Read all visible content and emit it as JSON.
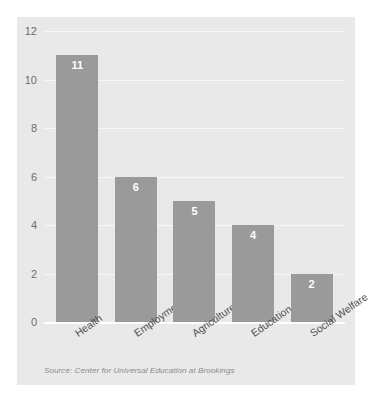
{
  "chart_data": {
    "type": "bar",
    "title": "",
    "xlabel": "",
    "ylabel": "",
    "categories": [
      "Health",
      "Employment",
      "Agriculture",
      "Education",
      "Social Welfare"
    ],
    "values": [
      11,
      6,
      5,
      4,
      2
    ],
    "value_labels": [
      "11",
      "6",
      "5",
      "4",
      "2"
    ],
    "ylim": [
      0,
      12
    ],
    "yticks": [
      0,
      2,
      4,
      6,
      8,
      10,
      12
    ],
    "ytick_labels": [
      "0",
      "2",
      "4",
      "6",
      "8",
      "10",
      "12"
    ],
    "grid": true,
    "legend": false,
    "orientation": "vertical",
    "xtick_rotation": -35,
    "source": "Source: Center for Universal Education at Brookings",
    "colors": {
      "bar": "#9a9a9a",
      "panel_background": "#e9e9e9",
      "page_background": "#ffffff",
      "gridline": "#f7f7f7",
      "baseline": "#ffffff",
      "value_label": "#ffffff",
      "ytick_label": "#6d6d6d",
      "xtick_label": "#4f4f4f",
      "source_text": "#8a8a8a"
    }
  }
}
